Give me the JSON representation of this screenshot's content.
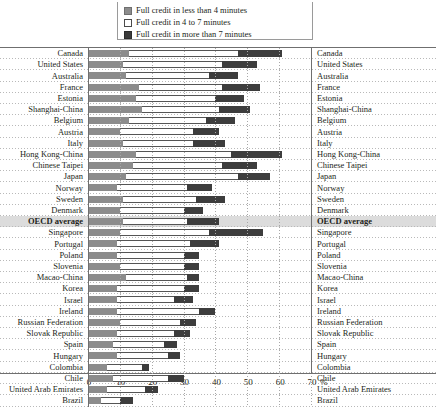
{
  "legend": {
    "items": [
      {
        "label": "Full credit in less than 4 minutes",
        "swatch": "light-gray-swatch-icon",
        "color": "#8c8c8c"
      },
      {
        "label": "Full credit in 4 to 7 minutes",
        "swatch": "white-swatch-icon",
        "color": "#ffffff"
      },
      {
        "label": "Full credit in more than 7 minutes",
        "swatch": "dark-gray-swatch-icon",
        "color": "#3d3d3d"
      }
    ]
  },
  "axis": {
    "ticks": [
      "0",
      "10",
      "20",
      "30",
      "40",
      "50",
      "60",
      "70"
    ],
    "unit": "%"
  },
  "chart_data": {
    "type": "bar",
    "orientation": "horizontal",
    "stacked": true,
    "title": "",
    "xlabel": "%",
    "ylabel": "",
    "xlim": [
      0,
      70
    ],
    "grid": true,
    "legend_position": "top",
    "categories": [
      "Canada",
      "United States",
      "Australia",
      "France",
      "Estonia",
      "Shanghai-China",
      "Belgium",
      "Austria",
      "Italy",
      "Hong Kong-China",
      "Chinese Taipei",
      "Japan",
      "Norway",
      "Sweden",
      "Denmark",
      "OECD average",
      "Singapore",
      "Portugal",
      "Poland",
      "Slovenia",
      "Macao-China",
      "Korea",
      "Israel",
      "Ireland",
      "Russian Federation",
      "Slovak Republic",
      "Spain",
      "Hungary",
      "Colombia",
      "Chile",
      "United Arab Emirates",
      "Brazil"
    ],
    "highlight_category": "OECD average",
    "series": [
      {
        "name": "Full credit in less than 4 minutes",
        "color": "#8c8c8c",
        "values": [
          13,
          11,
          12,
          16,
          15,
          17,
          13,
          10,
          11,
          15,
          14,
          12,
          9,
          11,
          10,
          11,
          10,
          9,
          9,
          10,
          12,
          9,
          9,
          9,
          10,
          9,
          8,
          9,
          6,
          8,
          6,
          4
        ]
      },
      {
        "name": "Full credit in 4 to 7 minutes",
        "color": "#ffffff",
        "values": [
          34,
          31,
          26,
          26,
          25,
          24,
          24,
          23,
          22,
          30,
          28,
          35,
          22,
          23,
          20,
          20,
          28,
          23,
          21,
          20,
          19,
          21,
          18,
          26,
          19,
          18,
          16,
          16,
          11,
          17,
          12,
          6
        ]
      },
      {
        "name": "Full credit in more than 7 minutes",
        "color": "#3d3d3d",
        "values": [
          14,
          11,
          9,
          12,
          9,
          10,
          9,
          8,
          10,
          16,
          11,
          10,
          8,
          9,
          6,
          10,
          17,
          9,
          5,
          5,
          4,
          5,
          6,
          5,
          5,
          5,
          4,
          4,
          2,
          5,
          4,
          4
        ]
      }
    ]
  }
}
